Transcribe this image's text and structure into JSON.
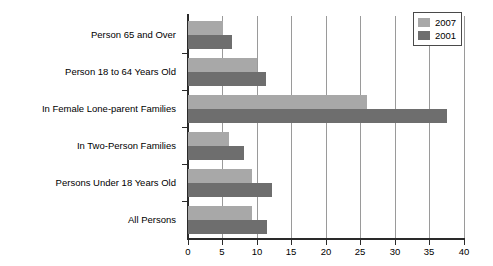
{
  "chart_data": {
    "type": "bar",
    "orientation": "horizontal",
    "title": "",
    "subtitle": "",
    "xlabel": "",
    "ylabel": "",
    "xlim": [
      0,
      40
    ],
    "xticks": [
      0,
      5,
      10,
      15,
      20,
      25,
      30,
      35,
      40
    ],
    "xtick_labels": [
      "0",
      "5",
      "10",
      "15",
      "20",
      "25",
      "30",
      "35",
      "40"
    ],
    "grid": "vertical",
    "legend_position": "top-right",
    "categories": [
      "Person 65 and Over",
      "Person 18 to 64 Years Old",
      "In Female Lone-parent Families",
      "In Two-Person Families",
      "Persons Under 18 Years Old",
      "All Persons"
    ],
    "series": [
      {
        "name": "2007",
        "color": "#a8a8a8",
        "values": [
          5.0,
          10.0,
          26.0,
          6.0,
          9.3,
          9.3
        ]
      },
      {
        "name": "2001",
        "color": "#6e6e6e",
        "values": [
          6.4,
          11.3,
          37.5,
          8.1,
          12.2,
          11.4
        ]
      }
    ]
  },
  "legend": {
    "entries": [
      {
        "label": "2007",
        "swatch": "light-gray-swatch"
      },
      {
        "label": "2001",
        "swatch": "dark-gray-swatch"
      }
    ]
  }
}
